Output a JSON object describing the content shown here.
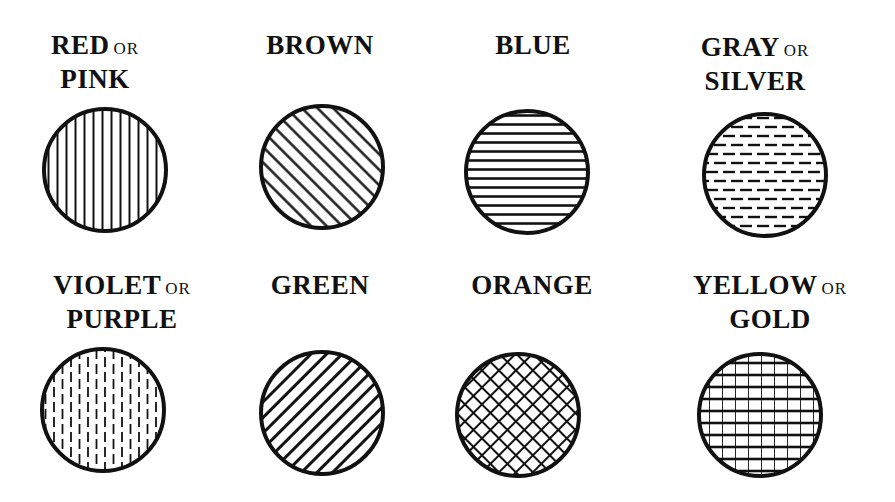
{
  "or_word": "OR",
  "swatches": [
    {
      "line1": "RED",
      "line1_or": true,
      "line2": "PINK",
      "pattern": "vertical-lines",
      "label_x": 95,
      "label_y": 30,
      "cx": 105,
      "cy": 170,
      "r": 62
    },
    {
      "line1": "BROWN",
      "line1_or": false,
      "line2": "",
      "pattern": "diagonal-lines-up",
      "label_x": 320,
      "label_y": 30,
      "cx": 322,
      "cy": 167,
      "r": 62
    },
    {
      "line1": "BLUE",
      "line1_or": false,
      "line2": "",
      "pattern": "horizontal-lines",
      "label_x": 533,
      "label_y": 30,
      "cx": 527,
      "cy": 172,
      "r": 62
    },
    {
      "line1": "GRAY",
      "line1_or": true,
      "line2": "SILVER",
      "pattern": "horizontal-dashes",
      "label_x": 755,
      "label_y": 32,
      "cx": 765,
      "cy": 175,
      "r": 62
    },
    {
      "line1": "VIOLET",
      "line1_or": true,
      "line2": "PURPLE",
      "pattern": "vertical-dashes",
      "label_x": 122,
      "label_y": 270,
      "cx": 103,
      "cy": 410,
      "r": 62
    },
    {
      "line1": "GREEN",
      "line1_or": false,
      "line2": "",
      "pattern": "diagonal-lines-down",
      "label_x": 320,
      "label_y": 270,
      "cx": 322,
      "cy": 413,
      "r": 62
    },
    {
      "line1": "ORANGE",
      "line1_or": false,
      "line2": "",
      "pattern": "diagonal-crosshatch",
      "label_x": 532,
      "label_y": 270,
      "cx": 518,
      "cy": 415,
      "r": 62
    },
    {
      "line1": "YELLOW",
      "line1_or": true,
      "line2": "GOLD",
      "pattern": "grid-crosshatch",
      "label_x": 770,
      "label_y": 270,
      "cx": 760,
      "cy": 415,
      "r": 62
    }
  ],
  "colors": {
    "ink": "#111111",
    "paper": "#ffffff"
  }
}
